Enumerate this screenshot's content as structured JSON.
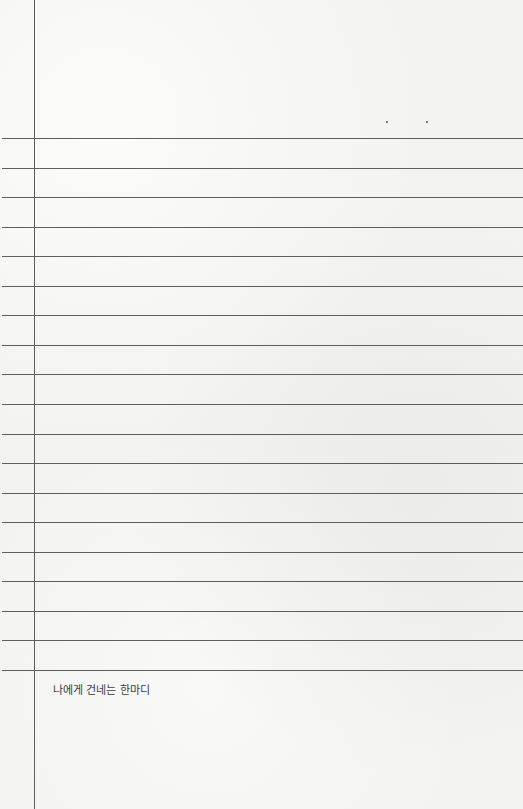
{
  "paper": {
    "background": "#f3f3f1",
    "line_color": "#5e5e5e",
    "margin_line_x": 34,
    "rule_first_y": 138,
    "rule_spacing": 29.55,
    "rule_count": 19
  },
  "decorations": {
    "dots": [
      {
        "x": 386,
        "y": 121
      },
      {
        "x": 426,
        "y": 121
      }
    ]
  },
  "caption": {
    "text": "나에게 건네는 한마디"
  }
}
